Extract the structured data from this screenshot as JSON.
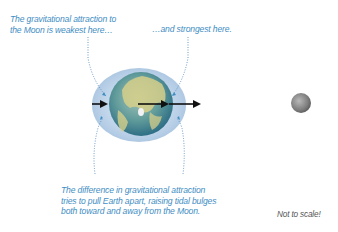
{
  "labels": {
    "weakest": "The gravitational attraction to\nthe Moon is weakest here…",
    "strongest": "…and strongest here.",
    "difference": "The difference in gravitational attraction\ntries to pull Earth apart, raising tidal bulges\nboth toward and away from the Moon.",
    "scale_note": "Not to scale!"
  },
  "colors": {
    "annotation_text": "#3f8ec4",
    "bulge": "#b7cfe6",
    "arrow": "#111111",
    "moon": "#8a8a8a"
  },
  "icons": {
    "earth": "earth-globe",
    "moon": "moon-sphere",
    "force_arrows": "right-arrow"
  }
}
